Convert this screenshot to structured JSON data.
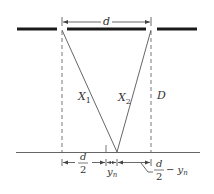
{
  "diagram": {
    "labels": {
      "slit_separation": "d",
      "path1": "X",
      "path1_sub": "1",
      "path2": "X",
      "path2_sub": "2",
      "screen_distance": "D",
      "half_d_num": "d",
      "half_d_den": "2",
      "y_n": "y",
      "y_n_sub": "n",
      "half_d_minus_num": "d",
      "half_d_minus_den": "2",
      "half_d_minus_rest": "− y",
      "half_d_minus_sub": "n"
    },
    "colors": {
      "barrier": "#1a1a1a",
      "line": "#444444",
      "text": "#333333"
    }
  }
}
